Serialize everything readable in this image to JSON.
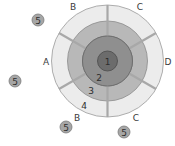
{
  "diagram": {
    "center": [
      107.5,
      61
    ],
    "rings": [
      {
        "id": "ring-4",
        "radius": 56,
        "fill": "#ececec",
        "stroke": "#9a9a9a"
      },
      {
        "id": "ring-3",
        "radius": 40,
        "fill": "#b8b8b8",
        "stroke": "#8a8a8a"
      },
      {
        "id": "ring-2",
        "radius": 25,
        "fill": "#8f8f8f",
        "stroke": "#6a6a6a"
      },
      {
        "id": "ring-1",
        "radius": 10,
        "fill": "#6c6c6c",
        "stroke": "#4a4a4a"
      }
    ],
    "spoke_color": "#a8a8a8",
    "spoke_angles_deg": [
      90,
      30,
      -30,
      -90,
      -150,
      150
    ],
    "sector_labels": [
      {
        "text": "B",
        "x": 73,
        "y": 7
      },
      {
        "text": "C",
        "x": 140,
        "y": 7
      },
      {
        "text": "A",
        "x": 46,
        "y": 62
      },
      {
        "text": "D",
        "x": 168,
        "y": 62
      },
      {
        "text": "B",
        "x": 77,
        "y": 118
      },
      {
        "text": "C",
        "x": 136,
        "y": 118
      }
    ],
    "zone_labels": [
      {
        "text": "1",
        "x": 107.5,
        "y": 62
      },
      {
        "text": "2",
        "x": 99,
        "y": 78
      },
      {
        "text": "3",
        "x": 91,
        "y": 91
      },
      {
        "text": "4",
        "x": 84,
        "y": 106
      }
    ],
    "outlier_markers": [
      {
        "text": "5",
        "x": 38,
        "y": 20
      },
      {
        "text": "5",
        "x": 15,
        "y": 81
      },
      {
        "text": "5",
        "x": 66,
        "y": 127
      },
      {
        "text": "5",
        "x": 124,
        "y": 132
      }
    ],
    "marker_fill": "#a6a6a6",
    "marker_stroke": "#7a7a7a"
  }
}
